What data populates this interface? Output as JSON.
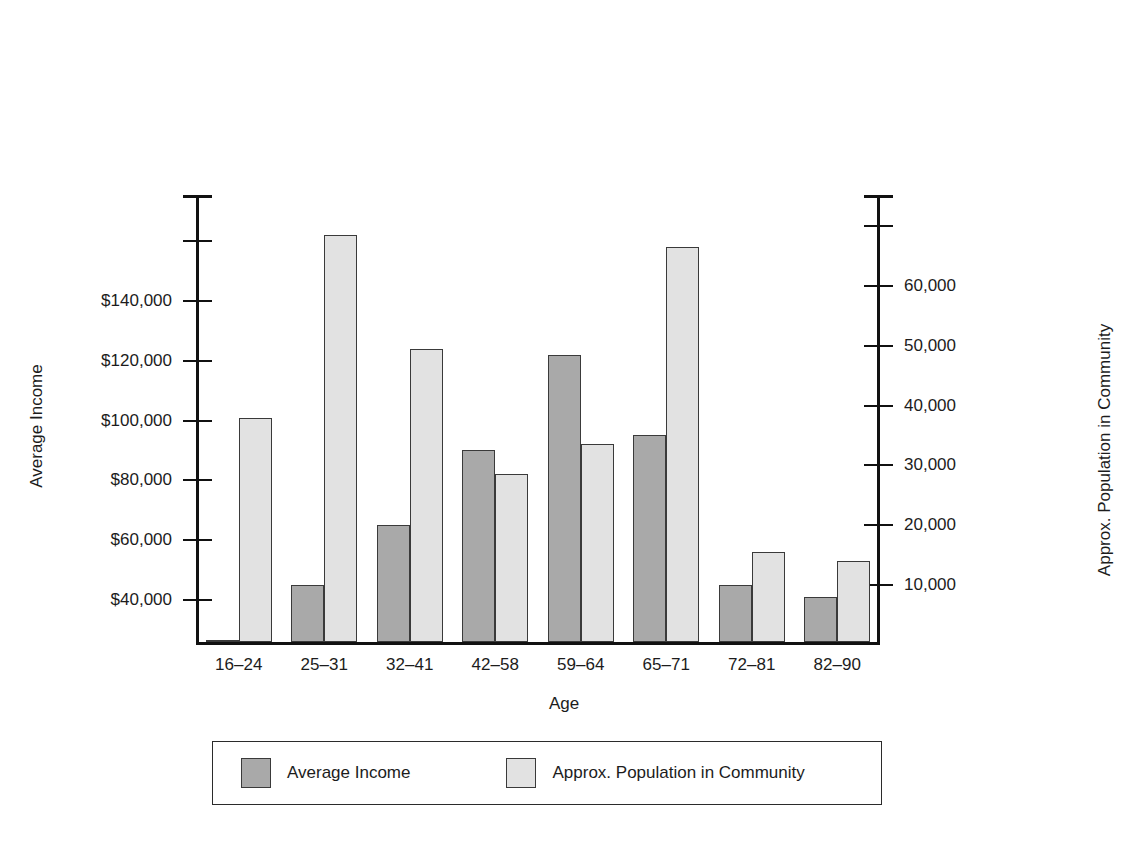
{
  "chart_data": {
    "type": "bar",
    "title": "",
    "subtitle": "",
    "xlabel": "Age",
    "ylabel": "Average Income",
    "y2label": "Approx. Population in Community",
    "grid": false,
    "legend_position": "bottom",
    "categories": [
      "16–24",
      "25–31",
      "32–41",
      "42–58",
      "59–64",
      "65–71",
      "72–81",
      "82–90"
    ],
    "series": [
      {
        "name": "Average Income",
        "axis": "left",
        "color": "#a9a9a9",
        "values": [
          17000,
          44000,
          64000,
          89000,
          121000,
          94000,
          44000,
          40000
        ]
      },
      {
        "name": "Approx. Population in Community",
        "axis": "right",
        "color": "#e2e2e2",
        "values": [
          37500,
          68000,
          49000,
          28000,
          33000,
          66000,
          15000,
          13500
        ]
      }
    ],
    "ylim": [
      25000,
      175000
    ],
    "y2lim": [
      0,
      75000
    ],
    "yticks": [
      40000,
      60000,
      80000,
      100000,
      120000,
      140000,
      160000,
      175000
    ],
    "ytick_labels": [
      "$40,000",
      "$60,000",
      "$80,000",
      "$100,000",
      "$120,000",
      "$140,000",
      "",
      ""
    ],
    "y2ticks": [
      10000,
      20000,
      30000,
      40000,
      50000,
      60000,
      70000,
      75000
    ],
    "y2tick_labels": [
      "10,000",
      "20,000",
      "30,000",
      "40,000",
      "50,000",
      "60,000",
      "",
      ""
    ]
  },
  "legend": {
    "items": [
      {
        "label": "Average Income",
        "swatch": "income-swatch"
      },
      {
        "label": "Approx. Population in Community",
        "swatch": "population-swatch"
      }
    ]
  }
}
